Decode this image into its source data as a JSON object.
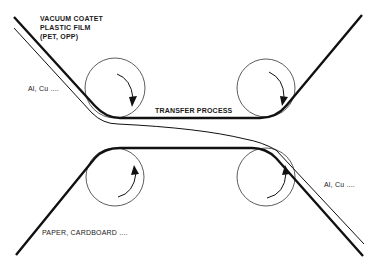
{
  "diagram": {
    "type": "transfer-metallization-process",
    "labels": {
      "film_line1": "VACUUM COATET",
      "film_line2": "PLASTIC FILM",
      "film_line3": "(PET, OPP)",
      "metal_left": "Al, Cu ....",
      "process": "TRANSFER PROCESS",
      "metal_right": "Al, Cu ....",
      "substrate": "PAPER, CARDBOARD ...."
    },
    "rollers": [
      {
        "name": "top-left-roller",
        "cx": 115,
        "cy": 88,
        "r": 30,
        "rotation": "clockwise"
      },
      {
        "name": "top-right-roller",
        "cx": 266,
        "cy": 88,
        "r": 29,
        "rotation": "clockwise"
      },
      {
        "name": "bottom-left-roller",
        "cx": 115,
        "cy": 177,
        "r": 29,
        "rotation": "counterclockwise"
      },
      {
        "name": "bottom-right-roller",
        "cx": 266,
        "cy": 177,
        "r": 29,
        "rotation": "counterclockwise"
      }
    ],
    "colors": {
      "line": "#111111",
      "background": "#ffffff"
    }
  }
}
